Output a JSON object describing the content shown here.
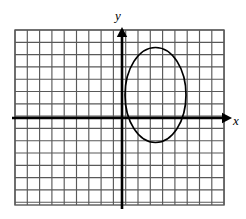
{
  "figure": {
    "width": 246,
    "height": 219,
    "background_color": "#ffffff"
  },
  "axes": {
    "x_axis_label": "x",
    "y_axis_label": "y",
    "origin_x": 122,
    "origin_y": 118,
    "axis_color": "#000000",
    "axis_stroke_width": 2.6,
    "x_axis_arrow_tip_x": 232,
    "y_axis_arrow_tip_y": 27,
    "x_label_pos": {
      "x": 236,
      "y": 122
    },
    "y_label_pos": {
      "x": 118,
      "y": 17
    }
  },
  "grid": {
    "left": 15,
    "top": 30,
    "right": 224,
    "bottom": 205,
    "cell_size": 12.3,
    "columns": 17,
    "rows": 14,
    "line_color": "#595959",
    "line_width": 1.15,
    "border_color": "#595959",
    "border_width": 1.4
  },
  "chart_data": {
    "type": "scatter",
    "title": "",
    "xlabel": "x",
    "ylabel": "y",
    "grid": true,
    "legend": null,
    "xlim": [
      -8.7,
      8.3
    ],
    "ylim": [
      -7.1,
      7.2
    ],
    "annotations": [
      {
        "text": "y",
        "x": -0.2,
        "y": 8.2
      },
      {
        "text": "x",
        "x": 9.3,
        "y": -0.3
      }
    ],
    "shapes": [
      {
        "kind": "ellipse",
        "label": "ellipse",
        "center": {
          "x": 2.7,
          "y": 1.9
        },
        "center_px": {
          "x": 155.5,
          "y": 95
        },
        "radius_x": 2.5,
        "radius_y": 3.9,
        "radius_x_px": 30.5,
        "radius_y_px": 47.5,
        "rotation_deg": 0,
        "stroke_color": "#000000",
        "stroke_width": 1.7,
        "fill": "none"
      }
    ]
  }
}
